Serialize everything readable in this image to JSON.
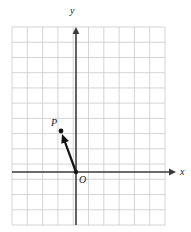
{
  "figure": {
    "background_color": "#ffffff"
  },
  "grid": {
    "left": 12,
    "top": 27,
    "right": 165,
    "bottom": 225,
    "spacing": 15.3,
    "columns": 10,
    "rows": 13,
    "color": "#c9c9cf",
    "line_width": 0.8
  },
  "axes": {
    "color": "#3a3a3a",
    "line_width": 1.6,
    "x_axis": {
      "label": "x",
      "y_position": 172,
      "start_x": 12,
      "end_x": 176,
      "arrow": "right"
    },
    "y_axis": {
      "label": "y",
      "x_position": 76,
      "start_y": 225,
      "end_y": 27,
      "arrow": "up"
    }
  },
  "points": [
    {
      "name": "P",
      "label": "P",
      "x": 61,
      "y": 131,
      "grid_x": -1,
      "grid_y": 2.7,
      "dot_radius": 2.4,
      "label_offset_x": -10,
      "label_offset_y": -5
    },
    {
      "name": "O",
      "label": "O",
      "x": 76,
      "y": 172,
      "grid_x": 0,
      "grid_y": 0,
      "dot_radius": 2.2,
      "label_offset_x": 3,
      "label_offset_y": 11
    }
  ],
  "vector": {
    "name": "OP",
    "from": "O",
    "to": "P",
    "from_x": 76,
    "from_y": 172,
    "to_x": 62,
    "to_y": 134,
    "color": "#141414",
    "line_width": 2.2,
    "arrowhead": "filled-triangle"
  }
}
